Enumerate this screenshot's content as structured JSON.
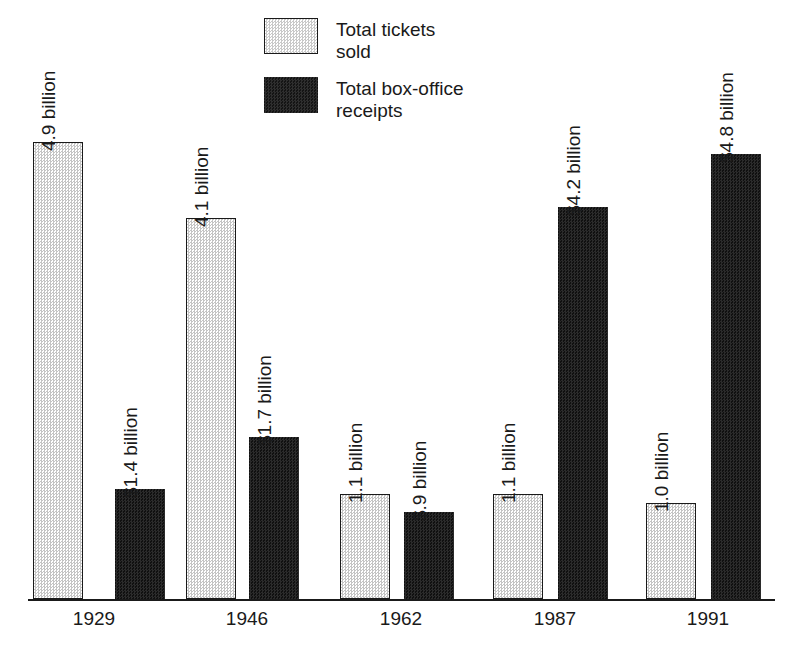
{
  "chart_data": {
    "type": "bar",
    "title": "",
    "subtitle": "",
    "xlabel": "",
    "ylabel": "",
    "grid": false,
    "legend_position": "top-center",
    "ylim": [
      0,
      5.2
    ],
    "categories": [
      "1929",
      "1946",
      "1962",
      "1987",
      "1991"
    ],
    "series": [
      {
        "name": "Total tickets sold",
        "units": "billions of tickets",
        "values": [
          4.9,
          4.1,
          1.1,
          1.1,
          1.0
        ],
        "labels": [
          "4.9 billion",
          "4.1 billion",
          "1.1 billion",
          "1.1 billion",
          "1.0 billion"
        ],
        "color": "#d9d9d9",
        "fill": "light-dither"
      },
      {
        "name": "Total box-office receipts",
        "units": "billions of US dollars",
        "values": [
          1.4,
          1.7,
          0.9,
          4.2,
          4.8
        ],
        "labels": [
          "$1.4 billion",
          "$1.7 billion",
          "$.9 billion",
          "$4.2 billion",
          "$4.8 billion"
        ],
        "color": "#1c1c1c",
        "fill": "solid-dark"
      }
    ]
  },
  "legend": {
    "items": [
      {
        "label": "Total tickets\nsold",
        "swatch": "light"
      },
      {
        "label": "Total box-office\nreceipts",
        "swatch": "dark"
      }
    ]
  },
  "axis": {
    "ticks": [
      "1929",
      "1946",
      "1962",
      "1987",
      "1991"
    ]
  },
  "bars": [
    {
      "group": "1929",
      "series": "tickets",
      "value_label": "4.9 billion",
      "left": 33,
      "top": 142,
      "width": 50,
      "height": 457,
      "kind": "light"
    },
    {
      "group": "1929",
      "series": "receipts",
      "value_label": "$1.4 billion",
      "left": 115,
      "top": 489,
      "width": 50,
      "height": 110,
      "kind": "dark"
    },
    {
      "group": "1946",
      "series": "tickets",
      "value_label": "4.1 billion",
      "left": 186,
      "top": 218,
      "width": 50,
      "height": 381,
      "kind": "light"
    },
    {
      "group": "1946",
      "series": "receipts",
      "value_label": "$1.7 billion",
      "left": 249,
      "top": 437,
      "width": 50,
      "height": 162,
      "kind": "dark"
    },
    {
      "group": "1962",
      "series": "tickets",
      "value_label": "1.1 billion",
      "left": 340,
      "top": 494,
      "width": 50,
      "height": 105,
      "kind": "light"
    },
    {
      "group": "1962",
      "series": "receipts",
      "value_label": "$.9 billion",
      "left": 404,
      "top": 512,
      "width": 50,
      "height": 87,
      "kind": "dark"
    },
    {
      "group": "1987",
      "series": "tickets",
      "value_label": "1.1 billion",
      "left": 493,
      "top": 494,
      "width": 50,
      "height": 105,
      "kind": "light"
    },
    {
      "group": "1987",
      "series": "receipts",
      "value_label": "$4.2 billion",
      "left": 558,
      "top": 207,
      "width": 50,
      "height": 392,
      "kind": "dark"
    },
    {
      "group": "1991",
      "series": "tickets",
      "value_label": "1.0 billion",
      "left": 646,
      "top": 503,
      "width": 50,
      "height": 96,
      "kind": "light"
    },
    {
      "group": "1991",
      "series": "receipts",
      "value_label": "$4.8 billion",
      "left": 711,
      "top": 154,
      "width": 50,
      "height": 445,
      "kind": "dark"
    }
  ],
  "value_label_positions": [
    {
      "left": 58,
      "bottom": 132
    },
    {
      "left": 140,
      "bottom": 479
    },
    {
      "left": 211,
      "bottom": 208
    },
    {
      "left": 274,
      "bottom": 427
    },
    {
      "left": 365,
      "bottom": 484
    },
    {
      "left": 429,
      "bottom": 502
    },
    {
      "left": 518,
      "bottom": 484
    },
    {
      "left": 583,
      "bottom": 197
    },
    {
      "left": 671,
      "bottom": 493
    },
    {
      "left": 736,
      "bottom": 144
    }
  ],
  "tick_positions": [
    {
      "left": 34
    },
    {
      "left": 187
    },
    {
      "left": 341
    },
    {
      "left": 495
    },
    {
      "left": 648
    }
  ]
}
